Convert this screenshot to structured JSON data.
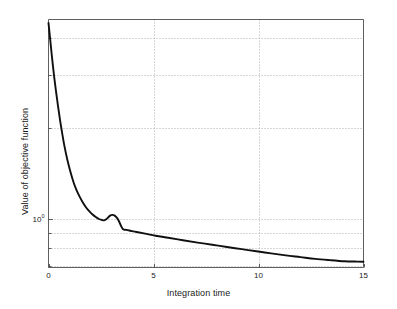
{
  "figure": {
    "background_color": "#ffffff",
    "axes_color": "#4d4d4d",
    "grid_color": "#9a9a9a",
    "line_color": "#101010",
    "width": 397,
    "height": 309
  },
  "chart_data": {
    "type": "line",
    "title": "",
    "xlabel": "Integration time",
    "ylabel": "Value of objective function",
    "xscale": "linear",
    "yscale": "log",
    "xlim": [
      0,
      15
    ],
    "ylim": [
      0.69,
      4.6
    ],
    "grid": true,
    "grid_style": "dotted",
    "legend": "none",
    "xticks": [
      0,
      5,
      10,
      15
    ],
    "xticklabels": [
      "0",
      "5",
      "10",
      "15"
    ],
    "yticks": [
      1
    ],
    "yticklabels": [
      "10"
    ],
    "ytick_exponents": [
      "0"
    ],
    "y_minor_gridlines": [
      0.7,
      0.8,
      0.9,
      1,
      2,
      3,
      4
    ],
    "series": [
      {
        "name": "objective",
        "x": [
          0.0,
          0.08,
          0.16,
          0.25,
          0.35,
          0.45,
          0.55,
          0.65,
          0.75,
          0.9,
          1.05,
          1.2,
          1.35,
          1.5,
          1.65,
          1.8,
          1.95,
          2.1,
          2.25,
          2.4,
          2.55,
          2.65,
          2.75,
          2.85,
          2.95,
          3.05,
          3.15,
          3.25,
          3.35,
          3.45,
          3.55,
          3.7,
          3.9,
          4.2,
          4.6,
          5.1,
          5.7,
          6.4,
          7.1,
          7.8,
          8.5,
          9.2,
          9.9,
          10.6,
          11.3,
          12.0,
          12.7,
          13.4,
          14.1,
          14.6,
          15.0
        ],
        "y": [
          4.48,
          3.95,
          3.48,
          3.05,
          2.68,
          2.38,
          2.13,
          1.93,
          1.76,
          1.57,
          1.43,
          1.32,
          1.24,
          1.18,
          1.13,
          1.09,
          1.06,
          1.035,
          1.015,
          1.0,
          0.992,
          0.99,
          0.998,
          1.014,
          1.028,
          1.032,
          1.026,
          1.01,
          0.985,
          0.95,
          0.925,
          0.92,
          0.914,
          0.905,
          0.894,
          0.88,
          0.866,
          0.85,
          0.835,
          0.821,
          0.807,
          0.794,
          0.781,
          0.769,
          0.757,
          0.747,
          0.737,
          0.73,
          0.724,
          0.722,
          0.721
        ]
      }
    ]
  }
}
